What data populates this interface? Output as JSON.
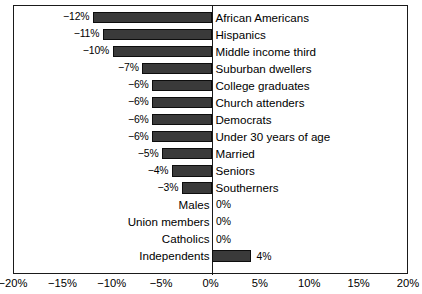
{
  "chart_data": {
    "type": "bar",
    "orientation": "horizontal",
    "title": "",
    "subtitle": "",
    "xlabel": "",
    "ylabel": "",
    "xlim": [
      -20,
      20
    ],
    "xticks": [
      -20,
      -15,
      -10,
      -5,
      0,
      5,
      10,
      15,
      20
    ],
    "xtick_labels": [
      "−20%",
      "−15%",
      "−10%",
      "−5%",
      "0%",
      "5%",
      "10%",
      "15%",
      "20%"
    ],
    "grid": false,
    "legend": null,
    "unit": "%",
    "bar_color": "#3a3a3a",
    "bar_edge_color": "#0d0d0d",
    "axis_color": "#1a1a1a",
    "background": "#ffffff",
    "categories": [
      "African Americans",
      "Hispanics",
      "Middle income third",
      "Suburban dwellers",
      "College graduates",
      "Church attenders",
      "Democrats",
      "Under 30 years of age",
      "Married",
      "Seniors",
      "Southerners",
      "Males",
      "Union members",
      "Catholics",
      "Independents"
    ],
    "values": [
      -12,
      -11,
      -10,
      -7,
      -6,
      -6,
      -6,
      -6,
      -5,
      -4,
      -3,
      0,
      0,
      0,
      4
    ],
    "value_labels": [
      "−12%",
      "−11%",
      "−10%",
      "−7%",
      "−6%",
      "−6%",
      "−6%",
      "−6%",
      "−5%",
      "−4%",
      "−3%",
      "0%",
      "0%",
      "0%",
      "4%"
    ],
    "bars": [
      {
        "category": "African Americans",
        "value": -12,
        "label": "−12%",
        "label_side": "left",
        "category_side": "right"
      },
      {
        "category": "Hispanics",
        "value": -11,
        "label": "−11%",
        "label_side": "left",
        "category_side": "right"
      },
      {
        "category": "Middle income third",
        "value": -10,
        "label": "−10%",
        "label_side": "left",
        "category_side": "right"
      },
      {
        "category": "Suburban dwellers",
        "value": -7,
        "label": "−7%",
        "label_side": "left",
        "category_side": "right"
      },
      {
        "category": "College graduates",
        "value": -6,
        "label": "−6%",
        "label_side": "left",
        "category_side": "right"
      },
      {
        "category": "Church attenders",
        "value": -6,
        "label": "−6%",
        "label_side": "left",
        "category_side": "right"
      },
      {
        "category": "Democrats",
        "value": -6,
        "label": "−6%",
        "label_side": "left",
        "category_side": "right"
      },
      {
        "category": "Under 30 years of age",
        "value": -6,
        "label": "−6%",
        "label_side": "left",
        "category_side": "right"
      },
      {
        "category": "Married",
        "value": -5,
        "label": "−5%",
        "label_side": "left",
        "category_side": "right"
      },
      {
        "category": "Seniors",
        "value": -4,
        "label": "−4%",
        "label_side": "left",
        "category_side": "right"
      },
      {
        "category": "Southerners",
        "value": -3,
        "label": "−3%",
        "label_side": "left",
        "category_side": "right"
      },
      {
        "category": "Males",
        "value": 0,
        "label": "0%",
        "label_side": "right",
        "category_side": "left"
      },
      {
        "category": "Union members",
        "value": 0,
        "label": "0%",
        "label_side": "right",
        "category_side": "left"
      },
      {
        "category": "Catholics",
        "value": 0,
        "label": "0%",
        "label_side": "right",
        "category_side": "left"
      },
      {
        "category": "Independents",
        "value": 4,
        "label": "4%",
        "label_side": "right",
        "category_side": "left"
      }
    ]
  }
}
